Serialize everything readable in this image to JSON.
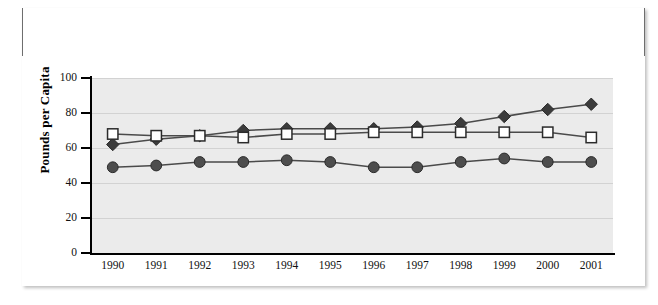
{
  "exhibit": {
    "label": "Exhibit 10",
    "title_line_1": "Consumption per Capita of Chicken, Beef, and Pork in the 1990s and Projected",
    "title_line_2": "Consumption for 2000, 2001"
  },
  "colors": {
    "title_bar_bg": "#4a4a4a",
    "title_text": "#ffffff",
    "plot_bg": "#ebebeb",
    "gridline": "#d2d2d2",
    "axis": "#000000",
    "chicken_marker_fill": "#3b3b3b",
    "beef_marker_fill": "#ffffff",
    "pork_marker_fill": "#4d4d4d",
    "line": "#4a4a4a"
  },
  "chart_data": {
    "type": "line",
    "title": "Consumption per Capita of Chicken, Beef, and Pork in the 1990s and Projected Consumption for 2000, 2001",
    "xlabel": "",
    "ylabel": "Pounds per Capita",
    "ylim": [
      0,
      100
    ],
    "yticks": [
      0,
      20,
      40,
      60,
      80,
      100
    ],
    "grid": true,
    "legend_position": "none",
    "categories": [
      "1990",
      "1991",
      "1992",
      "1993",
      "1994",
      "1995",
      "1996",
      "1997",
      "1998",
      "1999",
      "2000",
      "2001"
    ],
    "series": [
      {
        "name": "Chicken",
        "marker": "diamond",
        "values": [
          62,
          65,
          67,
          70,
          71,
          71,
          71,
          72,
          74,
          78,
          82,
          85
        ]
      },
      {
        "name": "Beef",
        "marker": "square-open",
        "values": [
          68,
          67,
          67,
          66,
          68,
          68,
          69,
          69,
          69,
          69,
          69,
          66
        ]
      },
      {
        "name": "Pork",
        "marker": "circle",
        "values": [
          49,
          50,
          52,
          52,
          53,
          52,
          49,
          49,
          52,
          54,
          52,
          52
        ]
      }
    ]
  }
}
